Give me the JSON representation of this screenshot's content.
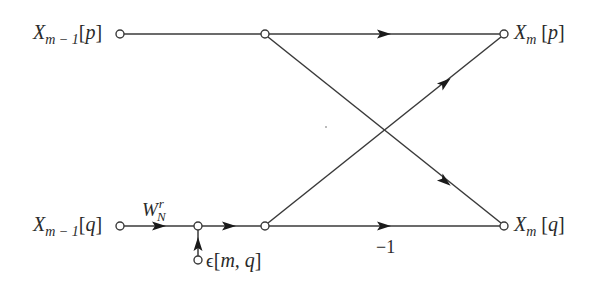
{
  "diagram": {
    "type": "signal-flow-graph (FFT butterfly with quantization noise)",
    "labels": {
      "in_p": {
        "main": "X",
        "sub": "m − 1",
        "open": "[",
        "arg": "p",
        "close": "]"
      },
      "in_q": {
        "main": "X",
        "sub": "m − 1",
        "open": "[",
        "arg": "q",
        "close": "]"
      },
      "out_p": {
        "main": "X",
        "sub": "m",
        "open": "[",
        "arg": "p",
        "close": "]"
      },
      "out_q": {
        "main": "X",
        "sub": "m",
        "open": "[",
        "arg": "q",
        "close": "]"
      },
      "twiddle": {
        "main": "W",
        "sup": "r",
        "sub": "N"
      },
      "noise": {
        "symbol": "ϵ",
        "open": "[",
        "args": "m, q",
        "close": "]"
      },
      "gain_minus_one": "−1"
    },
    "nodes": [
      {
        "id": "in_p",
        "x": 120,
        "y": 34
      },
      {
        "id": "top_mid",
        "x": 265,
        "y": 34
      },
      {
        "id": "out_p",
        "x": 504,
        "y": 34
      },
      {
        "id": "in_q",
        "x": 120,
        "y": 226
      },
      {
        "id": "adder",
        "x": 198,
        "y": 226
      },
      {
        "id": "bot_mid",
        "x": 265,
        "y": 226
      },
      {
        "id": "out_q",
        "x": 504,
        "y": 226
      },
      {
        "id": "noise_src",
        "x": 198,
        "y": 260
      }
    ],
    "edges": [
      {
        "from": "in_p",
        "to": "top_mid",
        "gain": ""
      },
      {
        "from": "top_mid",
        "to": "out_p",
        "gain": ""
      },
      {
        "from": "top_mid",
        "to": "out_q",
        "gain": ""
      },
      {
        "from": "in_q",
        "to": "adder",
        "gain": "W_N^r"
      },
      {
        "from": "noise_src",
        "to": "adder",
        "gain": ""
      },
      {
        "from": "adder",
        "to": "bot_mid",
        "gain": ""
      },
      {
        "from": "bot_mid",
        "to": "out_p",
        "gain": ""
      },
      {
        "from": "bot_mid",
        "to": "out_q",
        "gain": "−1"
      }
    ],
    "colors": {
      "line": "#3a3a3a",
      "arrow": "#1a1a1a",
      "text": "#2a2a2a",
      "background": "#ffffff"
    }
  }
}
